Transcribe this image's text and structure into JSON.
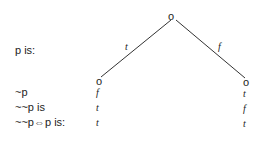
{
  "diagram": {
    "row_labels": [
      "p is:",
      "~p",
      "~~p is",
      "~~p⇔p is:"
    ],
    "edges": {
      "left": "t",
      "right": "f"
    },
    "left_column": [
      "t",
      "f",
      "t",
      "t"
    ],
    "right_column": [
      "f",
      "t",
      "f",
      "t"
    ],
    "root_node": "o",
    "left_node": "o",
    "right_node": "o"
  }
}
